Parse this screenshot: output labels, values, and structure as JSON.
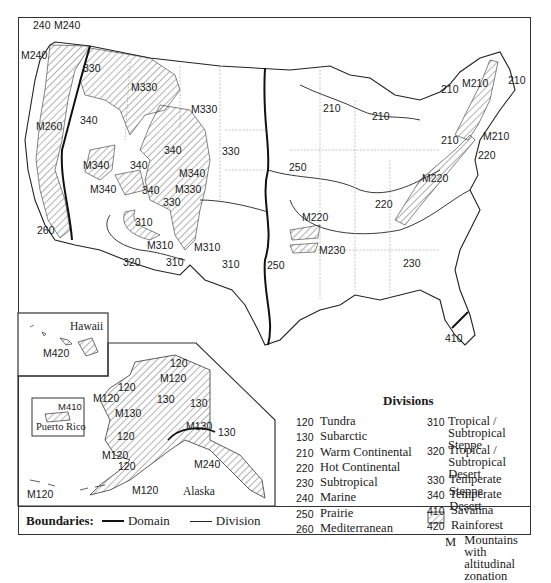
{
  "map": {
    "title": "Ecoregion Divisions of the United States",
    "conus_labels": [
      {
        "id": "240-nw",
        "text": "240",
        "x": 33,
        "y": 20
      },
      {
        "id": "m240-top",
        "text": "M240",
        "x": 54,
        "y": 20
      },
      {
        "id": "m240-left",
        "text": "M240",
        "x": 21,
        "y": 50
      },
      {
        "id": "330-nw",
        "text": "330",
        "x": 83,
        "y": 63
      },
      {
        "id": "m330-n",
        "text": "M330",
        "x": 131,
        "y": 82
      },
      {
        "id": "m330-ne",
        "text": "M330",
        "x": 191,
        "y": 104
      },
      {
        "id": "m260",
        "text": "M260",
        "x": 36,
        "y": 121
      },
      {
        "id": "340-w",
        "text": "340",
        "x": 80,
        "y": 115
      },
      {
        "id": "340-c",
        "text": "340",
        "x": 164,
        "y": 145
      },
      {
        "id": "330-c",
        "text": "330",
        "x": 222,
        "y": 146
      },
      {
        "id": "m340-w",
        "text": "M340",
        "x": 83,
        "y": 160
      },
      {
        "id": "340-s",
        "text": "340",
        "x": 130,
        "y": 160
      },
      {
        "id": "m340-e",
        "text": "M340",
        "x": 179,
        "y": 168
      },
      {
        "id": "m340-sw",
        "text": "M340",
        "x": 90,
        "y": 184
      },
      {
        "id": "340-se",
        "text": "340",
        "x": 142,
        "y": 185
      },
      {
        "id": "m330-s",
        "text": "M330",
        "x": 175,
        "y": 184
      },
      {
        "id": "330-s",
        "text": "330",
        "x": 163,
        "y": 197
      },
      {
        "id": "310-w",
        "text": "310",
        "x": 135,
        "y": 217
      },
      {
        "id": "260",
        "text": "260",
        "x": 37,
        "y": 225
      },
      {
        "id": "m310-w",
        "text": "M310",
        "x": 147,
        "y": 240
      },
      {
        "id": "m310-e",
        "text": "M310",
        "x": 194,
        "y": 242
      },
      {
        "id": "320",
        "text": "320",
        "x": 123,
        "y": 257
      },
      {
        "id": "310-s",
        "text": "310",
        "x": 166,
        "y": 257
      },
      {
        "id": "310-e",
        "text": "310",
        "x": 222,
        "y": 259
      },
      {
        "id": "250-s",
        "text": "250",
        "x": 267,
        "y": 260
      },
      {
        "id": "250-n",
        "text": "250",
        "x": 289,
        "y": 162
      },
      {
        "id": "210-mn",
        "text": "210",
        "x": 323,
        "y": 103
      },
      {
        "id": "210-mi",
        "text": "210",
        "x": 372,
        "y": 111
      },
      {
        "id": "210-ny",
        "text": "210",
        "x": 441,
        "y": 135
      },
      {
        "id": "210-ne",
        "text": "210",
        "x": 441,
        "y": 84
      },
      {
        "id": "m210-n",
        "text": "M210",
        "x": 462,
        "y": 78
      },
      {
        "id": "210-me",
        "text": "210",
        "x": 508,
        "y": 75
      },
      {
        "id": "m210-s",
        "text": "M210",
        "x": 483,
        "y": 131
      },
      {
        "id": "220-ne",
        "text": "220",
        "x": 478,
        "y": 150
      },
      {
        "id": "m220-e",
        "text": "M220",
        "x": 422,
        "y": 173
      },
      {
        "id": "220",
        "text": "220",
        "x": 375,
        "y": 199
      },
      {
        "id": "m220-w",
        "text": "M220",
        "x": 302,
        "y": 212
      },
      {
        "id": "m230",
        "text": "M230",
        "x": 319,
        "y": 245
      },
      {
        "id": "230",
        "text": "230",
        "x": 403,
        "y": 258
      },
      {
        "id": "410",
        "text": "410",
        "x": 445,
        "y": 333
      }
    ],
    "hawaii_inset": {
      "name": "Hawaii",
      "labels": [
        {
          "id": "m420",
          "text": "M420",
          "x": 43,
          "y": 348
        }
      ]
    },
    "puerto_rico_inset": {
      "name": "Puerto Rico",
      "labels": [
        {
          "id": "m410",
          "text": "M410",
          "x": 58,
          "y": 401
        }
      ]
    },
    "alaska_inset": {
      "name": "Alaska",
      "labels": [
        {
          "id": "ak-120-top",
          "text": "120",
          "x": 170,
          "y": 358
        },
        {
          "id": "ak-m120-top",
          "text": "M120",
          "x": 160,
          "y": 373
        },
        {
          "id": "ak-120-nw",
          "text": "120",
          "x": 118,
          "y": 382
        },
        {
          "id": "ak-m120-nw",
          "text": "M120",
          "x": 93,
          "y": 393
        },
        {
          "id": "ak-130-a",
          "text": "130",
          "x": 157,
          "y": 394
        },
        {
          "id": "ak-130-b",
          "text": "130",
          "x": 190,
          "y": 398
        },
        {
          "id": "ak-m130-a",
          "text": "M130",
          "x": 115,
          "y": 408
        },
        {
          "id": "ak-m130-b",
          "text": "M130",
          "x": 186,
          "y": 421
        },
        {
          "id": "ak-130-c",
          "text": "130",
          "x": 218,
          "y": 427
        },
        {
          "id": "ak-120-w",
          "text": "120",
          "x": 117,
          "y": 431
        },
        {
          "id": "ak-m120-w",
          "text": "M120",
          "x": 102,
          "y": 450
        },
        {
          "id": "ak-120-sw",
          "text": "120",
          "x": 118,
          "y": 461
        },
        {
          "id": "ak-m240",
          "text": "M240",
          "x": 194,
          "y": 459
        },
        {
          "id": "ak-m120-aleut",
          "text": "M120",
          "x": 27,
          "y": 489
        },
        {
          "id": "ak-m120-s",
          "text": "M120",
          "x": 132,
          "y": 485
        }
      ]
    }
  },
  "legend": {
    "title": "Divisions",
    "left_column": [
      {
        "code": "120",
        "name": "Tundra"
      },
      {
        "code": "130",
        "name": "Subarctic"
      },
      {
        "code": "210",
        "name": "Warm Continental"
      },
      {
        "code": "220",
        "name": "Hot Continental"
      },
      {
        "code": "230",
        "name": "Subtropical"
      },
      {
        "code": "240",
        "name": "Marine"
      },
      {
        "code": "250",
        "name": "Prairie"
      },
      {
        "code": "260",
        "name": "Mediterranean"
      }
    ],
    "right_column": [
      {
        "code": "310",
        "name": "Tropical /",
        "name2": "Subtropical Steppe"
      },
      {
        "code": "320",
        "name": "Tropical /",
        "name2": "Subtropical Desert"
      },
      {
        "code": "330",
        "name": "Temperate Steppe"
      },
      {
        "code": "340",
        "name": "Temperate Desert"
      },
      {
        "code": "410",
        "name": "Savanna"
      },
      {
        "code": "420",
        "name": "Rainforest"
      },
      {
        "code": "M",
        "name": "Mountains with",
        "name2": "altitudinal zonation"
      }
    ]
  },
  "boundaries": {
    "title": "Boundaries:",
    "domain_label": "Domain",
    "division_label": "Division"
  },
  "colors": {
    "line": "#222222",
    "hatch": "#555555",
    "background": "#ffffff"
  }
}
